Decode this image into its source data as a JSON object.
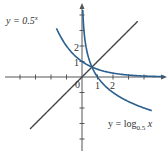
{
  "figure": {
    "origin_px": [
      82,
      77
    ],
    "unit_px": 15.5,
    "colors": {
      "curve": "#2a5f8f",
      "line": "#444444",
      "axis": "#555555"
    }
  },
  "labels": {
    "exp_label_prefix": "y = 0.5",
    "exp_label_sup": "x",
    "log_label_prefix": "y = log",
    "log_label_sub": "0.5",
    "log_label_var": " x",
    "origin": "0",
    "x_tick_1": "1",
    "x_tick_2": "2",
    "y_tick_1": "1",
    "y_tick_2": "2"
  },
  "chart_data": {
    "type": "line",
    "title": "",
    "xlabel": "x",
    "ylabel": "y",
    "xlim": [
      -5,
      5.5
    ],
    "ylim": [
      -4.7,
      4.7
    ],
    "grid": false,
    "x_ticks": [
      -4,
      -3,
      -2,
      -1,
      1,
      2,
      3,
      4
    ],
    "x_tick_labels": {
      "1": "1",
      "2": "2"
    },
    "y_ticks": [
      -4,
      -3,
      -2,
      -1,
      1,
      2,
      3,
      4
    ],
    "y_tick_labels": {
      "1": "1",
      "2": "2"
    },
    "series": [
      {
        "name": "y = 0.5^x",
        "function": "0.5^x",
        "x_range": [
          -1.65,
          5.3
        ]
      },
      {
        "name": "y = log_0.5 x",
        "function": "log_0.5(x)",
        "x_range": [
          0.05,
          4.5
        ]
      },
      {
        "name": "y = x",
        "function": "x",
        "x_range": [
          -3.35,
          3.6
        ]
      }
    ],
    "annotations": [
      "y = 0.5^x (upper left)",
      "y = log_0.5 x (lower right)",
      "0 at origin"
    ]
  }
}
